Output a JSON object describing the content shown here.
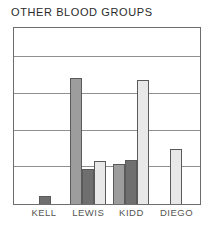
{
  "chart_data": {
    "type": "bar",
    "title": "OTHER BLOOD GROUPS",
    "xlabel": "",
    "ylabel": "",
    "categories": [
      "KELL",
      "LEWIS",
      "KIDD",
      "DIEGO"
    ],
    "ylim": [
      0,
      4.8
    ],
    "grid": true,
    "gridlines": [
      1,
      2,
      3,
      4
    ],
    "legend": "none",
    "axis_tick_labels": [],
    "series": [
      {
        "name": "series-1",
        "color": "#9d9d9d",
        "values": [
          null,
          3.43,
          1.08,
          null
        ]
      },
      {
        "name": "series-2",
        "color": "#6f6f6f",
        "values": [
          0.22,
          0.95,
          1.19,
          null
        ]
      },
      {
        "name": "series-3",
        "color": "#e8e8e8",
        "values": [
          null,
          1.16,
          3.38,
          1.49
        ]
      }
    ],
    "groups": [
      {
        "label": "KELL",
        "center_pct": 16.5,
        "bars": [
          {
            "swatch": "dark",
            "value": 0.22,
            "width_px": 12
          }
        ]
      },
      {
        "label": "LEWIS",
        "center_pct": 40.0,
        "bars": [
          {
            "swatch": "medium",
            "value": 3.43,
            "width_px": 12
          },
          {
            "swatch": "dark",
            "value": 0.95,
            "width_px": 12
          },
          {
            "swatch": "light",
            "value": 1.16,
            "width_px": 12
          }
        ]
      },
      {
        "label": "KIDD",
        "center_pct": 63.0,
        "bars": [
          {
            "swatch": "medium",
            "value": 1.08,
            "width_px": 12
          },
          {
            "swatch": "dark",
            "value": 1.19,
            "width_px": 12
          },
          {
            "swatch": "light",
            "value": 3.38,
            "width_px": 12
          }
        ]
      },
      {
        "label": "DIEGO",
        "center_pct": 87.0,
        "bars": [
          {
            "swatch": "light",
            "value": 1.49,
            "width_px": 12
          }
        ]
      }
    ]
  },
  "colors": {
    "frame": "#6d6d6d",
    "gridline": "#8f8f8f",
    "title_text": "#2b2b2b",
    "label_text": "#555555",
    "background": "#ffffff",
    "bar_edge": "#5a5a5a"
  }
}
